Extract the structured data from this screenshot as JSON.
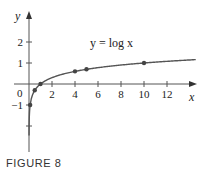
{
  "caption": "FIGURE 8",
  "chart_data": {
    "type": "line",
    "title": "",
    "curve_label": "y = log x",
    "function": "log10(x)",
    "xlabel": "x",
    "ylabel": "y",
    "xlim": [
      0,
      14
    ],
    "ylim": [
      -3,
      3
    ],
    "x_ticks": [
      2,
      4,
      6,
      8,
      10,
      12
    ],
    "x_tick_labels": [
      "2",
      "4",
      "6",
      "8",
      "10",
      "12"
    ],
    "y_ticks": [
      -2,
      -1,
      1,
      2
    ],
    "y_tick_labels": [
      "-1",
      "1",
      "2"
    ],
    "origin_label": "0",
    "marked_points": [
      {
        "x": 0.1,
        "y": -1
      },
      {
        "x": 0.5,
        "y": -0.301
      },
      {
        "x": 1,
        "y": 0
      },
      {
        "x": 4,
        "y": 0.602
      },
      {
        "x": 5,
        "y": 0.699
      },
      {
        "x": 10,
        "y": 1
      }
    ],
    "grid": false,
    "legend": "none",
    "asymptote": "x = 0 (vertical)"
  },
  "colors": {
    "curve": "#555555",
    "axis": "#555555",
    "point": "#444444",
    "text": "#222222"
  }
}
